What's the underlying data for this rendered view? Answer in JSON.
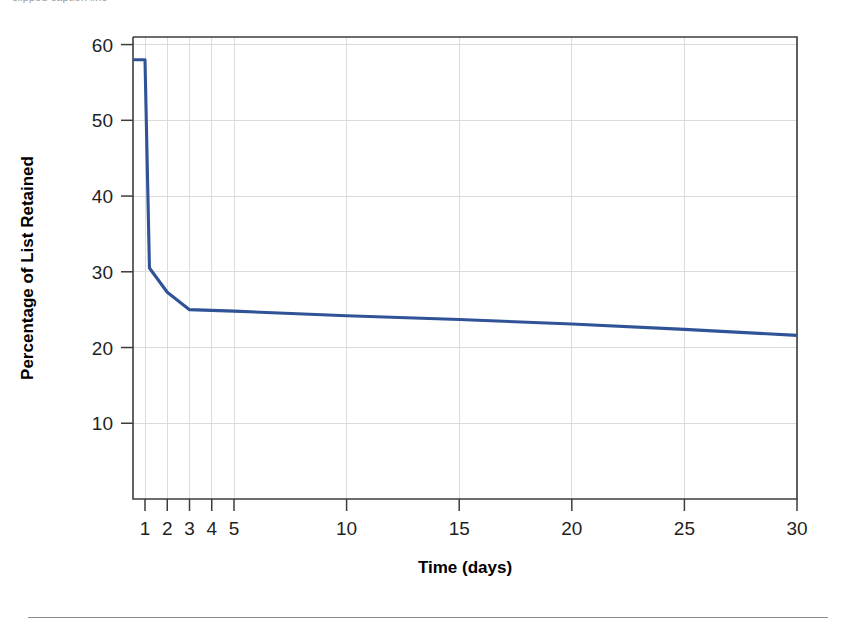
{
  "caption": {
    "text": "clipped caption line"
  },
  "figure": {
    "line_color": "#2f5396",
    "grid_color": "#d8d8d8",
    "axis_color": "#3d3d3d"
  },
  "chart_data": {
    "type": "line",
    "title": "",
    "xlabel": "Time (days)",
    "ylabel": "Percentage of List Retained",
    "x_scale": "piecewise (1-5 linear spacing, 5-30 linear spacing)",
    "xticks": [
      1,
      2,
      3,
      4,
      5,
      10,
      15,
      20,
      25,
      30
    ],
    "xticklabels": [
      "1",
      "2",
      "3",
      "4",
      "5",
      "10",
      "15",
      "20",
      "25",
      "30"
    ],
    "yticks": [
      10,
      20,
      30,
      40,
      50,
      60
    ],
    "yticklabels": [
      "10",
      "20",
      "30",
      "40",
      "50",
      "60"
    ],
    "ylim": [
      0,
      61
    ],
    "xlim": [
      0.5,
      30
    ],
    "grid": true,
    "legend": "none",
    "series": [
      {
        "name": "Percentage of List Retained",
        "x": [
          0.5,
          1,
          1.2,
          2,
          3,
          4,
          5,
          10,
          15,
          20,
          25,
          30
        ],
        "values": [
          58.0,
          58.0,
          30.5,
          27.3,
          25.0,
          24.9,
          24.8,
          24.2,
          23.7,
          23.1,
          22.4,
          21.6
        ]
      }
    ]
  }
}
